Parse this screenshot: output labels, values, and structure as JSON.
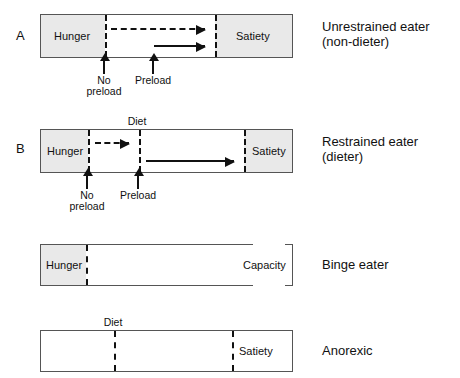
{
  "figure": {
    "background_color": "#ffffff",
    "line_color": "#111111",
    "shade_color": "#e9e9e9"
  },
  "panels": [
    {
      "id": "A",
      "letter": "A",
      "description": "Unrestrained eater\n(non-dieter)",
      "segments": [
        {
          "name": "hunger",
          "label": "Hunger"
        },
        {
          "name": "satiety",
          "label": "Satiety"
        }
      ],
      "dividers": [
        {
          "name": "hunger-boundary",
          "label": ""
        },
        {
          "name": "satiety-boundary",
          "label": ""
        }
      ],
      "arrows": [
        {
          "name": "no-preload-consumption",
          "style": "dashed"
        },
        {
          "name": "preload-consumption",
          "style": "solid"
        }
      ],
      "callouts": [
        {
          "name": "no-preload",
          "label": "No\npreload"
        },
        {
          "name": "preload",
          "label": "Preload"
        }
      ]
    },
    {
      "id": "B",
      "letter": "B",
      "description": "Restrained eater\n(dieter)",
      "segments": [
        {
          "name": "hunger",
          "label": "Hunger"
        },
        {
          "name": "satiety",
          "label": "Satiety"
        }
      ],
      "top_labels": [
        {
          "name": "diet-boundary",
          "label": "Diet"
        }
      ],
      "dividers": [
        {
          "name": "hunger-boundary",
          "label": ""
        },
        {
          "name": "diet-boundary",
          "label": "Diet"
        },
        {
          "name": "satiety-boundary",
          "label": ""
        }
      ],
      "arrows": [
        {
          "name": "no-preload-consumption",
          "style": "dashed"
        },
        {
          "name": "preload-counterregulation",
          "style": "solid"
        }
      ],
      "callouts": [
        {
          "name": "no-preload",
          "label": "No\npreload"
        },
        {
          "name": "preload",
          "label": "Preload"
        }
      ]
    },
    {
      "id": "C",
      "letter": "",
      "description": "Binge eater",
      "segments": [
        {
          "name": "hunger",
          "label": "Hunger"
        },
        {
          "name": "capacity",
          "label": "Capacity"
        }
      ],
      "dividers": [
        {
          "name": "hunger-boundary",
          "label": ""
        }
      ],
      "arrows": [],
      "callouts": []
    },
    {
      "id": "D",
      "letter": "",
      "description": "Anorexic",
      "segments": [
        {
          "name": "satiety",
          "label": "Satiety"
        }
      ],
      "top_labels": [
        {
          "name": "diet-boundary",
          "label": "Diet"
        }
      ],
      "dividers": [
        {
          "name": "diet-boundary",
          "label": "Diet"
        },
        {
          "name": "satiety-boundary",
          "label": ""
        }
      ],
      "arrows": [],
      "callouts": []
    }
  ]
}
